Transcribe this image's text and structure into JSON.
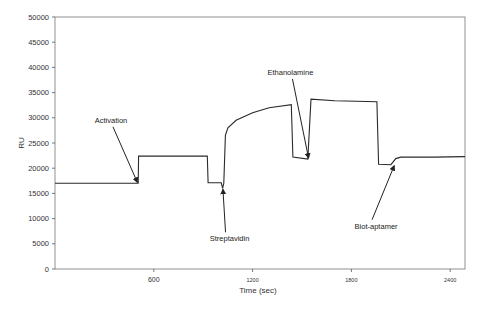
{
  "chart_data": {
    "type": "line",
    "title": "",
    "xlabel": "Time (sec)",
    "ylabel": "RU",
    "xlim": [
      0,
      2490
    ],
    "ylim": [
      0,
      50000
    ],
    "x_ticks": [
      600,
      1200,
      1800,
      2400
    ],
    "y_ticks": [
      0,
      5000,
      10000,
      15000,
      20000,
      25000,
      30000,
      35000,
      40000,
      45000,
      50000
    ],
    "grid": false,
    "legend": null,
    "series": [
      {
        "name": "SPR sensorgram",
        "points": [
          [
            0,
            17000
          ],
          [
            505,
            17000
          ],
          [
            508,
            22400
          ],
          [
            925,
            22400
          ],
          [
            930,
            17100
          ],
          [
            1010,
            17100
          ],
          [
            1018,
            16000
          ],
          [
            1025,
            17000
          ],
          [
            1035,
            26500
          ],
          [
            1050,
            28000
          ],
          [
            1100,
            29500
          ],
          [
            1200,
            31000
          ],
          [
            1300,
            32000
          ],
          [
            1435,
            32600
          ],
          [
            1445,
            22200
          ],
          [
            1535,
            21800
          ],
          [
            1555,
            33700
          ],
          [
            1700,
            33400
          ],
          [
            1955,
            33200
          ],
          [
            1965,
            20800
          ],
          [
            2040,
            20700
          ],
          [
            2070,
            21900
          ],
          [
            2100,
            22200
          ],
          [
            2300,
            22200
          ],
          [
            2490,
            22300
          ]
        ]
      }
    ],
    "annotations": [
      {
        "label": "Activation",
        "text_at": [
          340,
          29000
        ],
        "arrow_to": [
          500,
          17200
        ]
      },
      {
        "label": "Streptavidin",
        "text_at": [
          1060,
          5500
        ],
        "arrow_to": [
          1020,
          15800
        ]
      },
      {
        "label": "Ethanolamine",
        "text_at": [
          1430,
          38500
        ],
        "arrow_to": [
          1540,
          22000
        ]
      },
      {
        "label": "Biot-aptamer",
        "text_at": [
          1950,
          8000
        ],
        "arrow_to": [
          2060,
          20500
        ]
      }
    ]
  },
  "axes": {
    "xlabel": "Time (sec)",
    "ylabel": "RU",
    "x_tick_labels": [
      "600",
      "1200",
      "1800",
      "2400"
    ],
    "y_tick_labels": [
      "0",
      "5000",
      "10000",
      "15000",
      "20000",
      "25000",
      "30000",
      "35000",
      "40000",
      "45000",
      "50000"
    ]
  },
  "annotations": {
    "activation": "Activation",
    "streptavidin": "Streptavidin",
    "ethanolamine": "Ethanolamine",
    "biot_aptamer": "Biot-aptamer"
  },
  "colors": {
    "line": "#2a2a2a",
    "axis": "#555555",
    "text": "#333333"
  }
}
